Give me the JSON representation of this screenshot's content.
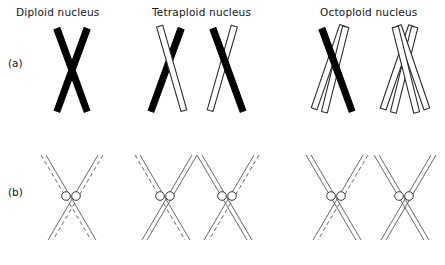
{
  "figure": {
    "title": "",
    "background_color": "#ffffff",
    "ink_color": "#000000",
    "outline_color": "#4d4d4d",
    "columns": [
      {
        "id": "diploid",
        "label": "Diploid nucleus",
        "label_x": 16,
        "label_y": 6,
        "ploidy": 2
      },
      {
        "id": "tetraploid",
        "label": "Tetraploid nucleus",
        "label_x": 152,
        "label_y": 6,
        "ploidy": 4
      },
      {
        "id": "octoploid",
        "label": "Octoploid nucleus",
        "label_x": 320,
        "label_y": 6,
        "ploidy": 8
      }
    ],
    "rows": [
      {
        "id": "row-a",
        "label": "(a)",
        "label_x": 8,
        "label_y": 57,
        "description": "whole chromosome silhouettes"
      },
      {
        "id": "row-b",
        "label": "(b)",
        "label_x": 8,
        "label_y": 186,
        "description": "DNA strand detail with centromeres"
      }
    ],
    "row_a": {
      "chromosomes": [
        {
          "name": "diploid-chromosome-1",
          "cx": 72,
          "cy": 70,
          "arm_a_style": "solid-black",
          "arm_b_style": "solid-black"
        },
        {
          "name": "tetraploid-chromosome-1",
          "cx": 166,
          "cy": 70,
          "arm_a_style": "solid-black",
          "arm_b_style": "single-outline"
        },
        {
          "name": "tetraploid-chromosome-2",
          "cx": 228,
          "cy": 70,
          "arm_a_style": "single-outline",
          "arm_b_style": "solid-black"
        },
        {
          "name": "octoploid-chromosome-1",
          "cx": 337,
          "cy": 70,
          "arm_a_style": "double-outline",
          "arm_b_style": "solid-black"
        },
        {
          "name": "octoploid-chromosome-2",
          "cx": 405,
          "cy": 70,
          "arm_a_style": "double-outline",
          "arm_b_style": "double-outline"
        }
      ]
    },
    "row_b": {
      "centromere_count_per_chromosome": 2,
      "chromosomes": [
        {
          "name": "diploid-strands-1",
          "cx": 72,
          "cy": 197,
          "arm_a_dashed": "outer",
          "arm_b_dashed": "outer"
        },
        {
          "name": "tetraploid-strands-1",
          "cx": 166,
          "cy": 197,
          "arm_a_dashed": "outer",
          "arm_b_dashed": "none"
        },
        {
          "name": "tetraploid-strands-2",
          "cx": 228,
          "cy": 197,
          "arm_a_dashed": "none",
          "arm_b_dashed": "outer"
        },
        {
          "name": "octoploid-strands-1",
          "cx": 337,
          "cy": 197,
          "arm_a_dashed": "none",
          "arm_b_dashed": "outer"
        },
        {
          "name": "octoploid-strands-2",
          "cx": 405,
          "cy": 197,
          "arm_a_dashed": "none",
          "arm_b_dashed": "none"
        }
      ]
    }
  }
}
